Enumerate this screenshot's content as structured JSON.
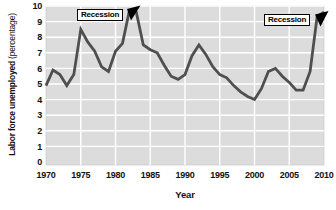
{
  "chart_data": {
    "type": "line",
    "title": "",
    "xlabel": "Year",
    "ylabel": "Labor force unemployed",
    "ylabel_suffix": "(percentage)",
    "xlim": [
      1970,
      2010
    ],
    "ylim": [
      0,
      10
    ],
    "x_ticks": [
      1970,
      1975,
      1980,
      1985,
      1990,
      1995,
      2000,
      2005,
      2010
    ],
    "y_ticks": [
      0,
      1,
      2,
      3,
      4,
      5,
      6,
      7,
      8,
      9,
      10
    ],
    "grid": true,
    "legend": "none",
    "colors": {
      "plot_background": "#dcdcdc",
      "gridline": "#ffffff",
      "line": "#4f4f4f",
      "text": "#111111",
      "annotation_border": "#000000",
      "annotation_background": "#ffffff"
    },
    "x": [
      1970,
      1971,
      1972,
      1973,
      1974,
      1975,
      1976,
      1977,
      1978,
      1979,
      1980,
      1981,
      1982,
      1983,
      1984,
      1985,
      1986,
      1987,
      1988,
      1989,
      1990,
      1991,
      1992,
      1993,
      1994,
      1995,
      1996,
      1997,
      1998,
      1999,
      2000,
      2001,
      2002,
      2003,
      2004,
      2005,
      2006,
      2007,
      2008,
      2009,
      2010
    ],
    "series": [
      {
        "name": "Labor force unemployed (percentage)",
        "values": [
          4.9,
          5.9,
          5.6,
          4.9,
          5.6,
          8.5,
          7.7,
          7.1,
          6.1,
          5.8,
          7.1,
          7.6,
          9.7,
          9.6,
          7.5,
          7.2,
          7.0,
          6.2,
          5.5,
          5.3,
          5.6,
          6.8,
          7.5,
          6.9,
          6.1,
          5.6,
          5.4,
          4.9,
          4.5,
          4.2,
          4.0,
          4.7,
          5.8,
          6.0,
          5.5,
          5.1,
          4.6,
          4.6,
          5.8,
          9.3,
          9.6
        ]
      }
    ],
    "annotations": [
      {
        "label": "Recession",
        "target_year": 1982
      },
      {
        "label": "Recession",
        "target_year": 2009
      }
    ]
  }
}
